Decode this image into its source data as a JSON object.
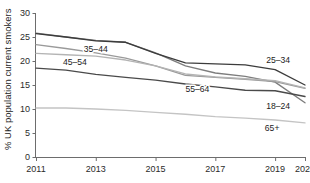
{
  "chart_data": {
    "type": "line",
    "title": "",
    "subtitle": "",
    "xlabel": "",
    "ylabel": "% UK population current smokers",
    "x": [
      2011,
      2012,
      2013,
      2014,
      2015,
      2016,
      2017,
      2018,
      2019,
      2020
    ],
    "xtick_labels": [
      "2011",
      "2013",
      "2015",
      "2017",
      "2019",
      "2020"
    ],
    "xticks": [
      2011,
      2013,
      2015,
      2017,
      2019,
      2020
    ],
    "ytick_labels": [
      "0",
      "5",
      "10",
      "15",
      "20",
      "25",
      "30"
    ],
    "yticks": [
      0,
      5,
      10,
      15,
      20,
      25,
      30
    ],
    "xlim": [
      2011,
      2020
    ],
    "ylim": [
      0,
      30
    ],
    "grid": false,
    "legend_position": "inline-annotations",
    "series": [
      {
        "name": "18–24",
        "label": "18–24",
        "color": "#7d7d7d",
        "values": [
          25.8,
          25.0,
          24.3,
          23.9,
          21.7,
          19.0,
          17.5,
          16.8,
          15.6,
          11.3
        ]
      },
      {
        "name": "25–34",
        "label": "25–34",
        "color": "#3c3c3c",
        "values": [
          25.7,
          25.0,
          24.2,
          23.9,
          21.6,
          19.6,
          19.4,
          19.2,
          18.2,
          15.0
        ]
      },
      {
        "name": "35–44",
        "label": "35–44",
        "color": "#9a9a9a",
        "values": [
          23.4,
          22.6,
          21.7,
          20.6,
          19.0,
          17.0,
          16.6,
          16.2,
          15.7,
          14.3
        ]
      },
      {
        "name": "45–54",
        "label": "45–54",
        "color": "#b4b4b4",
        "values": [
          21.6,
          21.3,
          21.0,
          20.2,
          19.0,
          17.3,
          16.7,
          16.3,
          15.9,
          14.4
        ]
      },
      {
        "name": "55–64",
        "label": "55–64",
        "color": "#4a4a4a",
        "values": [
          18.5,
          18.1,
          17.2,
          16.6,
          16.0,
          15.2,
          14.6,
          13.9,
          13.8,
          12.6
        ]
      },
      {
        "name": "65+",
        "label": "65+",
        "color": "#c4c4c4",
        "values": [
          10.2,
          10.2,
          10.0,
          9.7,
          9.3,
          8.9,
          8.4,
          8.1,
          7.7,
          7.1
        ]
      }
    ],
    "annotations": [
      {
        "text": "35–44",
        "x": 2013.0,
        "y": 21.9
      },
      {
        "text": "45–54",
        "x": 2012.3,
        "y": 19.2
      },
      {
        "text": "55–64",
        "x": 2016.4,
        "y": 13.6
      },
      {
        "text": "25–34",
        "x": 2019.1,
        "y": 19.6
      },
      {
        "text": "18–24",
        "x": 2019.1,
        "y": 10.1
      },
      {
        "text": "65+",
        "x": 2018.9,
        "y": 5.4
      }
    ]
  }
}
